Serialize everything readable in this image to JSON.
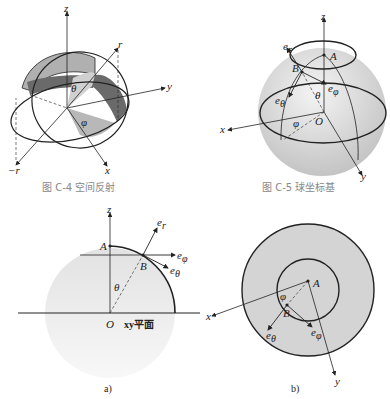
{
  "figures": [
    {
      "id": "C-4",
      "caption": "图 C-4   空间反射",
      "labels": {
        "z": "z",
        "y": "y",
        "x": "x",
        "r": "r",
        "neg_r": "−r",
        "theta": "θ",
        "phi": "φ"
      }
    },
    {
      "id": "C-5",
      "caption": "图 C-5   球坐标基",
      "labels": {
        "z": "z",
        "x": "x",
        "y": "y",
        "A": "A",
        "B": "B",
        "O": "O",
        "e_r": "e",
        "e_r_sub": "r",
        "e_theta": "e",
        "e_theta_sub": "θ",
        "e_phi": "e",
        "e_phi_sub": "φ",
        "theta": "θ",
        "phi": "φ"
      }
    },
    {
      "id": "a",
      "caption": "a)",
      "labels": {
        "z": "z",
        "A": "A",
        "B": "B",
        "O": "O",
        "plane": "xy平面",
        "theta": "θ",
        "e_r": "e",
        "e_r_sub": "r",
        "e_phi": "e",
        "e_phi_sub": "φ",
        "e_theta": "e",
        "e_theta_sub": "θ"
      }
    },
    {
      "id": "b",
      "caption": "b)",
      "labels": {
        "A": "A",
        "B": "B",
        "x": "x",
        "y": "y",
        "phi": "φ",
        "e_theta": "e",
        "e_theta_sub": "θ",
        "e_phi": "e",
        "e_phi_sub": "φ"
      }
    }
  ],
  "colors": {
    "line": "#222222",
    "shade_light": "#c8c8c8",
    "shade_mid": "#a8a8a8",
    "shade_dark": "#6a6a6a",
    "caption": "#888888"
  }
}
